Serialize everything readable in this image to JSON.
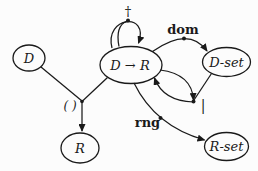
{
  "diagram": {
    "nodes": {
      "d": {
        "label": "D"
      },
      "map": {
        "label": "D → R"
      },
      "d_set": {
        "label": "D-set"
      },
      "r": {
        "label": "R"
      },
      "r_set": {
        "label": "R-set"
      }
    },
    "operations": {
      "override": {
        "symbol": "†"
      },
      "dom": {
        "label": "dom"
      },
      "restrict": {
        "symbol": "|"
      },
      "rng": {
        "label": "rng"
      },
      "apply": {
        "symbol": "( )"
      }
    },
    "colors": {
      "ink": "#1a1a1a",
      "background": "#fcfcfc"
    }
  }
}
